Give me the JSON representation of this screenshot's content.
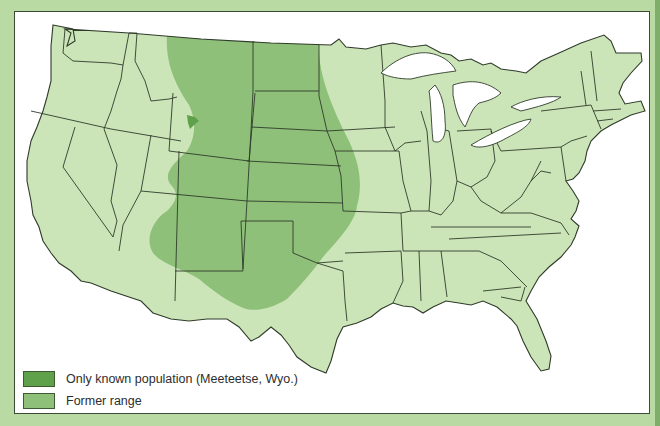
{
  "map": {
    "title": "",
    "region": "Contiguous United States",
    "colors": {
      "background_border": "#b9daa2",
      "right_strip": "#7fae6a",
      "frame": "#ffffff",
      "land": "#cce5b8",
      "state_border": "#2f3b2a",
      "former_range": "#8fc07a",
      "known_population": "#5fa04a"
    },
    "features": [
      {
        "name": "Former range",
        "description": "Broad band from Montana/North Dakota south through Wyoming, Colorado, Nebraska, Kansas, New Mexico, west Texas, eastern Arizona and Utah"
      },
      {
        "name": "Only known population",
        "location": "Meeteetse, Wyo.",
        "description": "Small spot in northwest Wyoming"
      }
    ]
  },
  "legend": {
    "items": [
      {
        "label": "Only known population (Meeteetse, Wyo.)",
        "color": "#5fa04a"
      },
      {
        "label": "Former range",
        "color": "#8fc07a"
      }
    ]
  }
}
